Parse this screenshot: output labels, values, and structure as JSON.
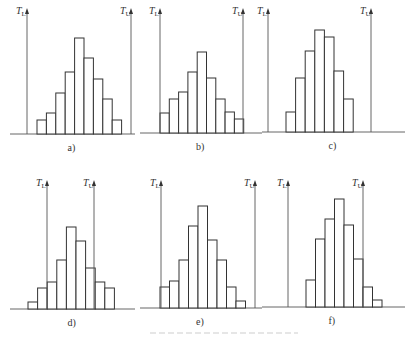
{
  "figure": {
    "caption_faded": "",
    "axis_label_lower": "T",
    "axis_sub_lower": "L",
    "axis_label_upper": "T",
    "axis_sub_upper": "U"
  },
  "chart_data": [
    {
      "type": "bar",
      "panel": "a)",
      "label": "a)",
      "baseline": 134,
      "tl_x": 27,
      "tu_x": 131,
      "bar_x0": 37,
      "bar_w": 9.4,
      "tops": [
        120,
        113,
        93,
        72,
        38,
        58,
        79,
        99,
        120
      ],
      "values": [
        2,
        3,
        6,
        9,
        14,
        11,
        8,
        5,
        2
      ]
    },
    {
      "type": "bar",
      "panel": "b)",
      "label": "b)",
      "baseline": 133,
      "tl_x": 160,
      "tu_x": 243,
      "bar_x0": 160,
      "bar_w": 9.3,
      "tops": [
        113,
        99,
        92,
        72,
        52,
        78,
        99,
        112,
        119
      ],
      "values": [
        3,
        5,
        6,
        9,
        12,
        8,
        5,
        3,
        2
      ]
    },
    {
      "type": "bar",
      "panel": "c)",
      "label": "c)",
      "baseline": 132,
      "tl_x": 268,
      "tu_x": 371,
      "bar_x0": 286,
      "bar_w": 9.6,
      "tops": [
        112,
        78,
        51,
        30,
        37,
        71,
        99
      ],
      "values": [
        3,
        8,
        12,
        15,
        14,
        9,
        5
      ]
    },
    {
      "type": "bar",
      "panel": "d)",
      "label": "d)",
      "baseline": 309,
      "tl_x": 47,
      "tu_x": 94,
      "bar_x0": 28,
      "bar_w": 9.6,
      "tops": [
        302,
        288,
        282,
        260,
        227,
        241,
        268,
        282,
        288
      ],
      "values": [
        1,
        3,
        4,
        7,
        12,
        10,
        6,
        4,
        3
      ]
    },
    {
      "type": "bar",
      "panel": "e)",
      "label": "e)",
      "baseline": 308,
      "tl_x": 161,
      "tu_x": 255,
      "bar_x0": 160,
      "bar_w": 9.5,
      "tops": [
        287,
        281,
        260,
        226,
        206,
        240,
        260,
        287,
        301
      ],
      "values": [
        3,
        4,
        7,
        12,
        15,
        10,
        7,
        3,
        1
      ]
    },
    {
      "type": "bar",
      "panel": "f)",
      "label": "f)",
      "baseline": 307,
      "tl_x": 288,
      "tu_x": 363,
      "bar_x0": 306,
      "bar_w": 9.5,
      "tops": [
        280,
        239,
        219,
        199,
        225,
        259,
        287,
        300
      ],
      "values": [
        4,
        10,
        13,
        16,
        12,
        7,
        3,
        1
      ]
    }
  ]
}
